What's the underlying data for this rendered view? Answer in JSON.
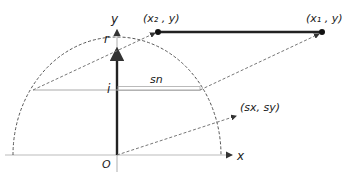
{
  "diagram": {
    "labels": {
      "y_axis": "y",
      "x_axis": "x",
      "origin": "O",
      "radius": "r",
      "index": "i",
      "span": "sn",
      "point_x2": "(x₂ , y)",
      "point_x1": "(x₁ , y)",
      "screen_point": "(sx, sy)"
    },
    "colors": {
      "line": "#222222",
      "dashed": "#555555",
      "thin": "#999999",
      "background": "#ffffff"
    }
  }
}
